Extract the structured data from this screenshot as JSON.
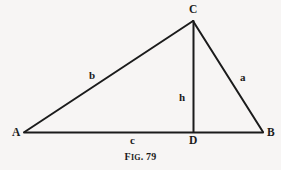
{
  "figure": {
    "caption_prefix": "F",
    "caption_smallcaps": "IG",
    "caption_suffix": ". 79",
    "caption_full": "FIG. 79",
    "background_color": "#f7f5f4",
    "ink_color": "#1b1b1b"
  },
  "vertices": {
    "A": {
      "label": "A",
      "x": 24,
      "y": 132
    },
    "B": {
      "label": "B",
      "x": 263,
      "y": 132
    },
    "C": {
      "label": "C",
      "x": 193,
      "y": 21
    },
    "D": {
      "label": "D",
      "x": 193,
      "y": 132
    }
  },
  "sides": {
    "a": {
      "label": "a",
      "from": "C",
      "to": "B"
    },
    "b": {
      "label": "b",
      "from": "A",
      "to": "C"
    },
    "c": {
      "label": "c",
      "from": "A",
      "to": "D"
    },
    "h": {
      "label": "h",
      "from": "C",
      "to": "D"
    }
  }
}
